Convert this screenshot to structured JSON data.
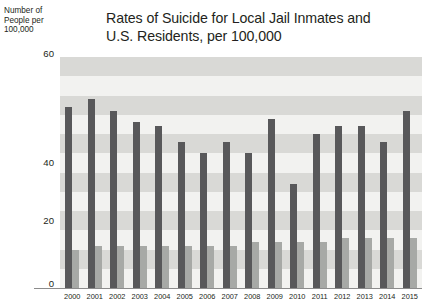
{
  "chart_data": {
    "type": "bar",
    "title": "Rates of Suicide for Local Jail Inmates and U.S. Residents, per 100,000",
    "title_line1": "Rates of Suicide for Local Jail Inmates and",
    "title_line2": "U.S. Residents, per 100,000",
    "ylabel": "Number of People per 100,000",
    "ylabel_line1": "Number of",
    "ylabel_line2": "People per",
    "ylabel_line3": "100,000",
    "xlabel": "",
    "ylim": [
      0,
      60
    ],
    "yticks": [
      0,
      20,
      40,
      60
    ],
    "ytick_labels": [
      "0",
      "20",
      "40",
      "60"
    ],
    "grid": "horizontal-bands",
    "legend_position": "top-right",
    "categories": [
      "2000",
      "2001",
      "2002",
      "2003",
      "2004",
      "2005",
      "2006",
      "2007",
      "2008",
      "2009",
      "2010",
      "2011",
      "2012",
      "2013",
      "2014",
      "2015"
    ],
    "series": [
      {
        "name": "Jail suicide rate",
        "color": "#58585a",
        "values": [
          47,
          49,
          46,
          43,
          42,
          38,
          35,
          38,
          35,
          44,
          27,
          40,
          42,
          42,
          38,
          46
        ]
      },
      {
        "name": "U.S. suicide rate",
        "color": "#a7a9a6",
        "values": [
          10,
          11,
          11,
          11,
          11,
          11,
          11,
          11,
          12,
          12,
          12,
          12,
          13,
          13,
          13,
          13
        ]
      }
    ]
  },
  "legend": {
    "items": [
      {
        "label": "Jail suicide rate",
        "color": "#58585a"
      },
      {
        "label": "U.S. suicide rate",
        "color": "#a7a9a6"
      }
    ]
  },
  "colors": {
    "jail_bar": "#58585a",
    "us_bar": "#a7a9a6",
    "plot_background": "#f2f2f0",
    "band_light": "#f2f2f0",
    "band_dark": "#d9d9d6",
    "axis_line": "#8c8c8c",
    "text": "#231f20"
  }
}
